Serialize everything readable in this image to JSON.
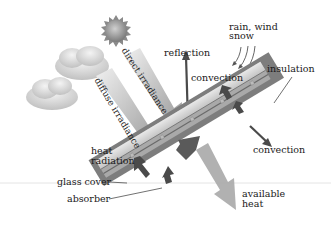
{
  "diagram": {
    "labels": {
      "direct_irradiance": "direct irradiance",
      "diffuse_irradiance": "diffuse irradiance",
      "reflection": "reflection",
      "rain_wind_snow_line1": "rain, wind",
      "rain_wind_snow_line2": "snow",
      "convection_top": "convection",
      "insulation": "insulation",
      "convection_right": "convection",
      "heat_radiation_line1": "heat",
      "heat_radiation_line2": "radiation",
      "glass_cover": "glass cover",
      "absorber": "absorber",
      "available_heat_line1": "available",
      "available_heat_line2": "heat"
    },
    "colors": {
      "background": "#ffffff",
      "insulation_frame": "#7a7a7a",
      "glass_cover": "#cfcfcf",
      "absorber": "#a8a8a8",
      "dark_arrow": "#4a4a4a",
      "light_arrow": "#a0a0a0",
      "text": "#1a1a1a"
    }
  }
}
